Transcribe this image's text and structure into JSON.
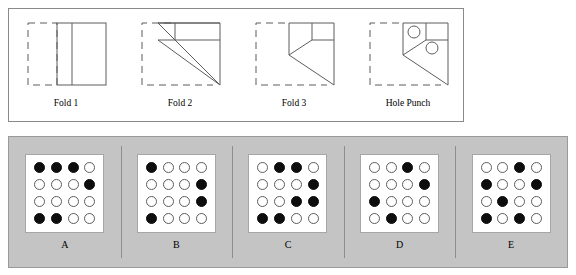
{
  "puzzle": {
    "type": "paper-folding-hole-punch",
    "fold_panel": {
      "steps": [
        {
          "id": "fold-1",
          "label": "Fold 1",
          "description": "Square sheet folded left edge over to the right; dashed outline shows original left half, solid outline shows folded paper with vertical crease."
        },
        {
          "id": "fold-2",
          "label": "Fold 2",
          "description": "Diagonal fold bringing lower-left corner up; dashed original square at left, solid shape with horizontal band across the top and a vertical divider, plus a long diagonal crease running to the bottom-right corner."
        },
        {
          "id": "fold-3",
          "label": "Fold 3",
          "description": "Further fold narrowing the shape; a small square remains at the top right and a chevron-shaped diagonal crease points left."
        },
        {
          "id": "hole-punch",
          "label": "Hole Punch",
          "description": "Two holes punched through the folded packet: one inside the small upper-left square, one below and to its right."
        }
      ]
    },
    "options_panel": {
      "grid_rows": 4,
      "grid_cols": 4,
      "legend": {
        "filled": "punched hole",
        "open": "no hole"
      },
      "options": [
        {
          "label": "A",
          "grid": [
            [
              "filled",
              "filled",
              "filled",
              "open"
            ],
            [
              "open",
              "open",
              "open",
              "filled"
            ],
            [
              "open",
              "open",
              "open",
              "open"
            ],
            [
              "filled",
              "filled",
              "open",
              "open"
            ]
          ]
        },
        {
          "label": "B",
          "grid": [
            [
              "filled",
              "open",
              "open",
              "open"
            ],
            [
              "open",
              "open",
              "open",
              "filled"
            ],
            [
              "open",
              "open",
              "open",
              "filled"
            ],
            [
              "filled",
              "open",
              "open",
              "open"
            ]
          ]
        },
        {
          "label": "C",
          "grid": [
            [
              "open",
              "filled",
              "filled",
              "open"
            ],
            [
              "open",
              "open",
              "open",
              "filled"
            ],
            [
              "open",
              "open",
              "filled",
              "filled"
            ],
            [
              "filled",
              "filled",
              "open",
              "open"
            ]
          ]
        },
        {
          "label": "D",
          "grid": [
            [
              "open",
              "open",
              "filled",
              "open"
            ],
            [
              "open",
              "open",
              "open",
              "filled"
            ],
            [
              "filled",
              "open",
              "open",
              "open"
            ],
            [
              "open",
              "filled",
              "open",
              "open"
            ]
          ]
        },
        {
          "label": "E",
          "grid": [
            [
              "open",
              "open",
              "filled",
              "open"
            ],
            [
              "filled",
              "open",
              "open",
              "filled"
            ],
            [
              "open",
              "filled",
              "open",
              "open"
            ],
            [
              "filled",
              "open",
              "filled",
              "open"
            ]
          ]
        }
      ]
    },
    "colors": {
      "page_background": "#ffffff",
      "panel_background": "#c4c4c4",
      "card_background": "#ffffff",
      "line": "#5d5d5d",
      "hole_fill": "#0d0d0d",
      "border": "#8a8a8a"
    }
  }
}
